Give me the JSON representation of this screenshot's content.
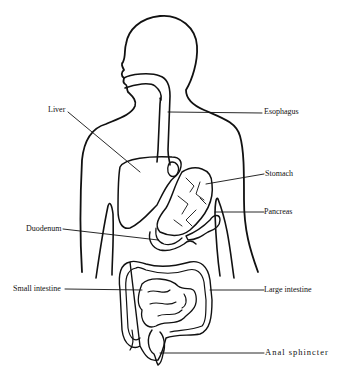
{
  "diagram": {
    "labels": {
      "liver": "Liver",
      "esophagus": "Esophagus",
      "stomach": "Stomach",
      "pancreas": "Pancreas",
      "duodenum": "Duodenum",
      "small_intestine": "Small intestine",
      "large_intestine": "Large intestine",
      "anal_sphincter": "Anal sphincter"
    },
    "colors": {
      "line": "#111111",
      "background": "#ffffff"
    }
  }
}
